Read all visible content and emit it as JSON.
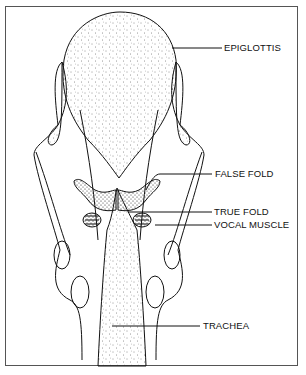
{
  "figure": {
    "labels": [
      {
        "id": "epiglottis",
        "text": "EPIGLOTTIS"
      },
      {
        "id": "false-fold",
        "text": "FALSE FOLD"
      },
      {
        "id": "true-fold",
        "text": "TRUE FOLD"
      },
      {
        "id": "vocal-muscle",
        "text": "VOCAL MUSCLE"
      },
      {
        "id": "trachea",
        "text": "TRACHEA"
      }
    ]
  }
}
